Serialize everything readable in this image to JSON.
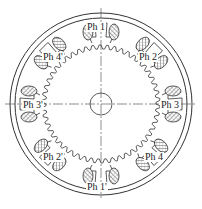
{
  "diagram": {
    "type": "stepper-motor-cross-section",
    "stator_poles": 8,
    "labels": {
      "ph1": "Ph 1",
      "ph1p": "Ph 1'",
      "ph2": "Ph 2",
      "ph2p": "Ph 2'",
      "ph3": "Ph 3",
      "ph3p": "Ph 3'",
      "ph4": "Ph 4",
      "ph4p": "Ph 4'"
    },
    "colors": {
      "line": "#333333",
      "hatch": "#777777",
      "background": "#ffffff"
    }
  }
}
